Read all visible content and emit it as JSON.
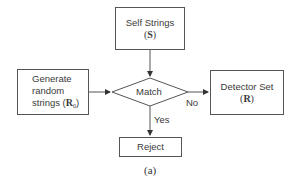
{
  "diagram": {
    "self_strings": {
      "line1": "Self Strings",
      "symbol": "S"
    },
    "generate": {
      "line1": "Generate",
      "line2": "random",
      "line3_prefix": "strings (",
      "symbol": "R",
      "subscript": "0",
      "line3_suffix": ")"
    },
    "match": {
      "label": "Match"
    },
    "detector_set": {
      "line1": "Detector Set",
      "symbol": "R"
    },
    "reject": {
      "label": "Reject"
    },
    "edges": {
      "no_label": "No",
      "yes_label": "Yes"
    },
    "caption": "(a)"
  },
  "colors": {
    "stroke": "#555555",
    "text": "#3a3a3a",
    "background": "#ffffff"
  }
}
